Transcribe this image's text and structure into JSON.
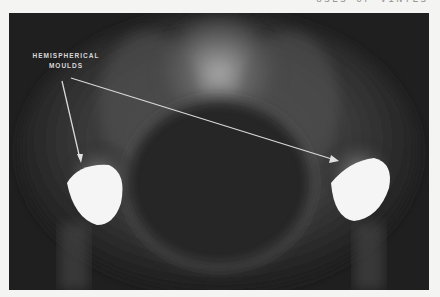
{
  "header": {
    "running_title": "USES OF VINYLS"
  },
  "figure": {
    "annotation_line1": "HEMISPHERICAL",
    "annotation_line2": "MOULDS"
  }
}
